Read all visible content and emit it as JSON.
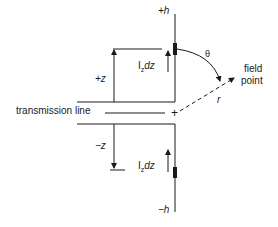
{
  "diagram": {
    "labels": {
      "top_end": "+h",
      "bottom_end": "−h",
      "plus_z": "+z",
      "minus_z": "−z",
      "current_top": "I",
      "current_top_sub": "z",
      "current_top_suffix": "dz",
      "current_bottom": "I",
      "current_bottom_sub": "z",
      "current_bottom_suffix": "dz",
      "theta": "θ",
      "field_point_line1": "field",
      "field_point_line2": "point",
      "distance": "r",
      "transmission_line": "transmission line",
      "origin": "+"
    },
    "colors": {
      "stroke": "#1a1a1a",
      "background": "#ffffff"
    }
  }
}
